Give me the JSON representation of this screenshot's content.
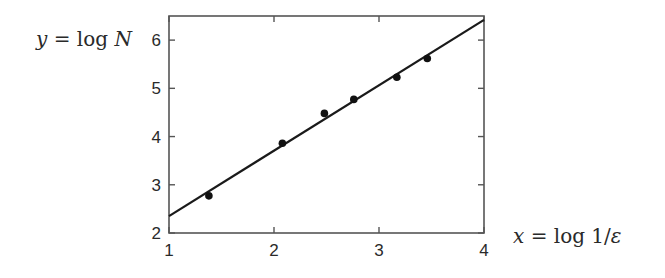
{
  "chart_data": {
    "type": "scatter",
    "title": "",
    "xlabel": "x = log 1/ε",
    "ylabel": "y = log N",
    "xlim": [
      1,
      4
    ],
    "ylim": [
      2,
      6.5
    ],
    "xticks": [
      1,
      2,
      3,
      4
    ],
    "yticks": [
      2,
      3,
      4,
      5,
      6
    ],
    "grid": false,
    "legend": null,
    "series": [
      {
        "name": "data",
        "kind": "scatter",
        "x": [
          1.38,
          2.08,
          2.48,
          2.76,
          3.17,
          3.46
        ],
        "y": [
          2.77,
          3.86,
          4.48,
          4.77,
          5.23,
          5.62
        ]
      },
      {
        "name": "fit",
        "kind": "line",
        "x": [
          1,
          4
        ],
        "y": [
          2.35,
          6.42
        ]
      }
    ]
  },
  "labels": {
    "xlabel_parts": [
      "x",
      " = log 1/",
      "ε"
    ],
    "ylabel_parts": [
      "y",
      " = log ",
      "N"
    ]
  },
  "colors": {
    "axis": "#555555",
    "line": "#1a1a1a",
    "marker": "#111111"
  }
}
